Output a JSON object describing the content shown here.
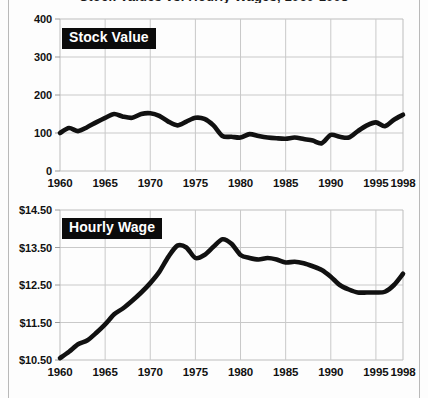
{
  "figure": {
    "clipped_title": "Stock Values vs. Hourly Wages, 1960-1998",
    "background_color": "#fdfdfd",
    "line_color": "#111111",
    "grid_color": "#c9c9c9",
    "label_box_bg": "#0b0b0b",
    "label_box_fg": "#ffffff"
  },
  "chart_data": [
    {
      "type": "line",
      "title": "Stock Value",
      "xlabel": "",
      "ylabel": "",
      "xlim": [
        1960,
        1998
      ],
      "ylim": [
        0,
        400
      ],
      "grid": true,
      "legend_position": "inside-top-left",
      "yticks": [
        "400",
        "300",
        "200",
        "100",
        "0"
      ],
      "ytick_values": [
        400,
        300,
        200,
        100,
        0
      ],
      "xticks": [
        "1960",
        "1965",
        "1970",
        "1975",
        "1980",
        "1985",
        "1990",
        "1995",
        "1998"
      ],
      "xtick_values": [
        1960,
        1965,
        1970,
        1975,
        1980,
        1985,
        1990,
        1995,
        1998
      ],
      "x": [
        1960,
        1961,
        1962,
        1963,
        1964,
        1965,
        1966,
        1967,
        1968,
        1969,
        1970,
        1971,
        1972,
        1973,
        1974,
        1975,
        1976,
        1977,
        1978,
        1979,
        1980,
        1981,
        1982,
        1983,
        1984,
        1985,
        1986,
        1987,
        1988,
        1989,
        1990,
        1991,
        1992,
        1993,
        1994,
        1995,
        1996,
        1997,
        1998
      ],
      "values": [
        100,
        113,
        105,
        115,
        128,
        140,
        150,
        143,
        140,
        150,
        152,
        145,
        130,
        120,
        130,
        140,
        137,
        120,
        92,
        90,
        88,
        97,
        92,
        88,
        86,
        85,
        88,
        84,
        80,
        73,
        95,
        90,
        88,
        105,
        120,
        128,
        118,
        135,
        148
      ]
    },
    {
      "type": "line",
      "title": "Hourly Wage",
      "xlabel": "",
      "ylabel": "",
      "xlim": [
        1960,
        1998
      ],
      "ylim": [
        10.5,
        14.5
      ],
      "grid": true,
      "legend_position": "inside-top-left",
      "yticks": [
        "$14.50",
        "$13.50",
        "$12.50",
        "$11.50",
        "$10.50"
      ],
      "ytick_values": [
        14.5,
        13.5,
        12.5,
        11.5,
        10.5
      ],
      "xticks": [
        "1960",
        "1965",
        "1970",
        "1975",
        "1980",
        "1985",
        "1990",
        "1995",
        "1998"
      ],
      "xtick_values": [
        1960,
        1965,
        1970,
        1975,
        1980,
        1985,
        1990,
        1995,
        1998
      ],
      "x": [
        1960,
        1961,
        1962,
        1963,
        1964,
        1965,
        1966,
        1967,
        1968,
        1969,
        1970,
        1971,
        1972,
        1973,
        1974,
        1975,
        1976,
        1977,
        1978,
        1979,
        1980,
        1981,
        1982,
        1983,
        1984,
        1985,
        1986,
        1987,
        1988,
        1989,
        1990,
        1991,
        1992,
        1993,
        1994,
        1995,
        1996,
        1997,
        1998
      ],
      "values": [
        10.55,
        10.72,
        10.92,
        11.02,
        11.22,
        11.45,
        11.72,
        11.88,
        12.08,
        12.3,
        12.55,
        12.85,
        13.25,
        13.55,
        13.5,
        13.22,
        13.3,
        13.52,
        13.72,
        13.6,
        13.3,
        13.22,
        13.18,
        13.22,
        13.18,
        13.1,
        13.12,
        13.08,
        13.0,
        12.9,
        12.72,
        12.5,
        12.38,
        12.3,
        12.3,
        12.3,
        12.32,
        12.5,
        12.8
      ]
    }
  ]
}
